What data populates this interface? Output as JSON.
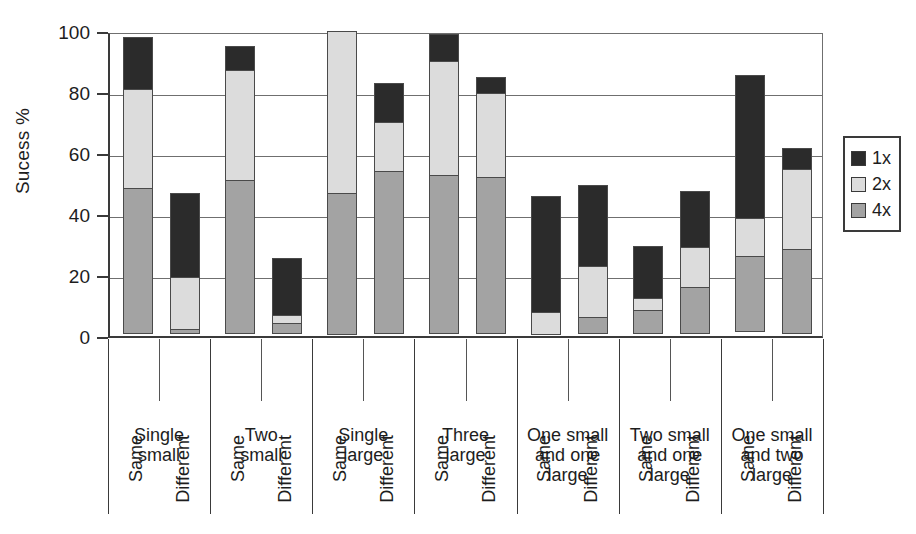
{
  "chart_data": {
    "type": "bar",
    "stacked": true,
    "title": "",
    "xlabel": "",
    "ylabel": "Sucess %",
    "ylim": [
      0,
      100
    ],
    "yticks": [
      0,
      20,
      40,
      60,
      80,
      100
    ],
    "ytick_labels": [
      "0",
      "20",
      "40",
      "60",
      "80",
      "100"
    ],
    "grid": true,
    "legend_position": "right",
    "series": [
      {
        "name": "1x",
        "color": "#2b2b2b",
        "values": [
          17.5,
          28.0,
          8.0,
          19.0,
          0.0,
          13.0,
          9.0,
          5.5,
          38.5,
          27.0,
          17.5,
          18.5,
          47.0,
          7.0
        ]
      },
      {
        "name": "2x",
        "color": "#dcdcdc",
        "values": [
          32.5,
          17.5,
          36.5,
          3.0,
          53.5,
          16.5,
          38.0,
          28.0,
          7.5,
          17.0,
          4.0,
          13.5,
          13.0,
          26.5
        ]
      },
      {
        "name": "4x",
        "color": "#a3a3a3",
        "values": [
          48.0,
          1.5,
          50.5,
          3.5,
          46.5,
          53.5,
          52.0,
          51.5,
          0.0,
          5.5,
          8.0,
          15.5,
          25.0,
          28.0
        ]
      }
    ],
    "categories": [
      "Single small / Same",
      "Single small / Different",
      "Two small / Same",
      "Two small / Different",
      "Single large / Same",
      "Single large / Different",
      "Three large / Same",
      "Three large / Different",
      "One small and one large / Same",
      "One small and one large / Different",
      "Two small and one large / Same",
      "Two small and one large / Different",
      "One small and two large / Same",
      "One small and two large / Different"
    ],
    "totals": [
      98.0,
      47.0,
      95.0,
      25.5,
      100.0,
      83.0,
      99.0,
      85.0,
      46.0,
      49.5,
      29.5,
      47.5,
      85.5,
      61.5
    ],
    "groups": [
      {
        "label_lines": [
          "Single",
          "small"
        ],
        "bars": [
          {
            "condition": "Same",
            "segments": {
              "4x": 48.0,
              "2x": 32.5,
              "1x": 17.5
            },
            "total": 98.0
          },
          {
            "condition": "Different",
            "segments": {
              "4x": 1.5,
              "2x": 17.5,
              "1x": 28.0
            },
            "total": 47.0
          }
        ]
      },
      {
        "label_lines": [
          "Two",
          "small"
        ],
        "bars": [
          {
            "condition": "Same",
            "segments": {
              "4x": 50.5,
              "2x": 36.5,
              "1x": 8.0
            },
            "total": 95.0
          },
          {
            "condition": "Different",
            "segments": {
              "4x": 3.5,
              "2x": 3.0,
              "1x": 19.0
            },
            "total": 25.5
          }
        ]
      },
      {
        "label_lines": [
          "Single",
          "large"
        ],
        "bars": [
          {
            "condition": "Same",
            "segments": {
              "4x": 46.5,
              "2x": 53.5,
              "1x": 0.0
            },
            "total": 100.0
          },
          {
            "condition": "Different",
            "segments": {
              "4x": 53.5,
              "2x": 16.5,
              "1x": 13.0
            },
            "total": 83.0
          }
        ]
      },
      {
        "label_lines": [
          "Three",
          "large"
        ],
        "bars": [
          {
            "condition": "Same",
            "segments": {
              "4x": 52.0,
              "2x": 38.0,
              "1x": 9.0
            },
            "total": 99.0
          },
          {
            "condition": "Different",
            "segments": {
              "4x": 51.5,
              "2x": 28.0,
              "1x": 5.5
            },
            "total": 85.0
          }
        ]
      },
      {
        "label_lines": [
          "One small",
          "and one",
          "large"
        ],
        "bars": [
          {
            "condition": "Same",
            "segments": {
              "4x": 0.0,
              "2x": 7.5,
              "1x": 38.5
            },
            "total": 46.0
          },
          {
            "condition": "Different",
            "segments": {
              "4x": 5.5,
              "2x": 17.0,
              "1x": 27.0
            },
            "total": 49.5
          }
        ]
      },
      {
        "label_lines": [
          "Two small",
          "and one",
          "large"
        ],
        "bars": [
          {
            "condition": "Same",
            "segments": {
              "4x": 8.0,
              "2x": 4.0,
              "1x": 17.5
            },
            "total": 29.5
          },
          {
            "condition": "Different",
            "segments": {
              "4x": 15.5,
              "2x": 13.5,
              "1x": 18.5
            },
            "total": 47.5
          }
        ]
      },
      {
        "label_lines": [
          "One small",
          "and two",
          "large"
        ],
        "bars": [
          {
            "condition": "Same",
            "segments": {
              "4x": 25.0,
              "2x": 13.0,
              "1x": 47.0
            },
            "total": 85.5
          },
          {
            "condition": "Different",
            "segments": {
              "4x": 28.0,
              "2x": 26.5,
              "1x": 7.0
            },
            "total": 61.5
          }
        ]
      }
    ],
    "legend": [
      {
        "label": "1x",
        "color": "#2b2b2b"
      },
      {
        "label": "2x",
        "color": "#dcdcdc"
      },
      {
        "label": "4x",
        "color": "#a3a3a3"
      }
    ]
  }
}
